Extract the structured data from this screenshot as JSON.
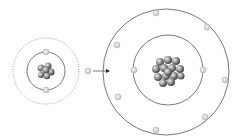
{
  "diagram": {
    "small_atom": {
      "center": [
        46,
        71
      ],
      "inner_orbit_radius": 19,
      "outer_orbit_radius": 33,
      "outer_orbit_style": "dotted",
      "electrons": [
        [
          46,
          52
        ],
        [
          46,
          90
        ]
      ]
    },
    "ejected_electron": [
      88,
      71
    ],
    "arrow": {
      "from": [
        93,
        71
      ],
      "to": [
        109,
        71
      ]
    },
    "large_atom": {
      "center": [
        165,
        72
      ],
      "inner_orbit_radius": 34,
      "outer_orbit_radius": 63,
      "inner_electrons": [
        [
          133,
          70
        ],
        [
          203,
          70
        ]
      ],
      "outer_electrons": [
        [
          156,
          13
        ],
        [
          207,
          27
        ],
        [
          225,
          80
        ],
        [
          205,
          117
        ],
        [
          156,
          130
        ],
        [
          118,
          97
        ],
        [
          117,
          45
        ]
      ]
    },
    "colors": {
      "orbit": "#555555",
      "electron": "#dddddd",
      "electron_stroke": "#aaaaaa",
      "nucleus": "#777777"
    }
  }
}
